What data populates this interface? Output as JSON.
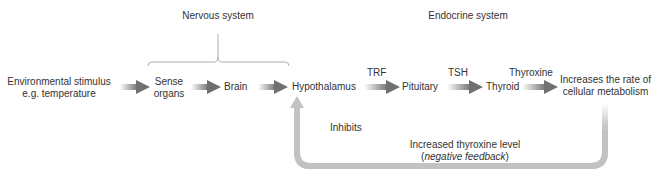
{
  "headers": {
    "nervous": "Nervous system",
    "endocrine": "Endocrine system"
  },
  "nodes": {
    "stimulus_line1": "Environmental stimulus",
    "stimulus_line2": "e.g. temperature",
    "sense_line1": "Sense",
    "sense_line2": "organs",
    "brain": "Brain",
    "hypothalamus": "Hypothalamus",
    "pituitary": "Pituitary",
    "thyroid": "Thyroid",
    "outcome_line1": "Increases the rate of",
    "outcome_line2": "cellular metabolism"
  },
  "edge_labels": {
    "trf": "TRF",
    "tsh": "TSH",
    "thyroxine": "Thyroxine"
  },
  "feedback": {
    "inhibits": "Inhibits",
    "line1": "Increased thyroxine level",
    "line2_open": "(",
    "line2_italic": "negative feedback",
    "line2_close": ")"
  },
  "colors": {
    "text": "#333333",
    "arrow": "#7a7a7a",
    "feedback_arrow": "#c4c4c4",
    "bracket": "#999999"
  }
}
